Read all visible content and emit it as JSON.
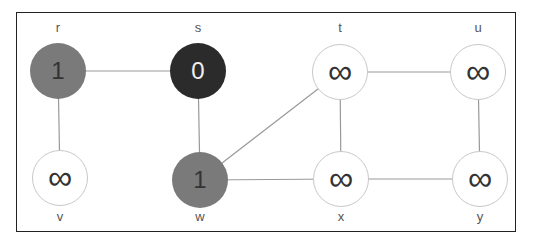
{
  "graph": {
    "type": "undirected",
    "description": "BFS state: source s discovered with distance 0, neighbors r and w at distance 1, all others infinity",
    "colors": {
      "white": "#ffffff",
      "gray": "#7a7a7a",
      "black": "#2b2b2b",
      "edge": "#999999",
      "border": "#222222"
    },
    "nodes": [
      {
        "id": "r",
        "label": "r",
        "value": "1",
        "state": "gray",
        "cx": 58,
        "cy": 71
      },
      {
        "id": "s",
        "label": "s",
        "value": "0",
        "state": "black",
        "cx": 198,
        "cy": 71
      },
      {
        "id": "t",
        "label": "t",
        "value": "∞",
        "state": "white",
        "cx": 340,
        "cy": 72
      },
      {
        "id": "u",
        "label": "u",
        "value": "∞",
        "state": "white",
        "cx": 478,
        "cy": 72
      },
      {
        "id": "v",
        "label": "v",
        "value": "∞",
        "state": "white",
        "cx": 60,
        "cy": 178
      },
      {
        "id": "w",
        "label": "w",
        "value": "1",
        "state": "gray",
        "cx": 200,
        "cy": 180
      },
      {
        "id": "x",
        "label": "x",
        "value": "∞",
        "state": "white",
        "cx": 341,
        "cy": 179
      },
      {
        "id": "y",
        "label": "y",
        "value": "∞",
        "state": "white",
        "cx": 480,
        "cy": 179
      }
    ],
    "edges": [
      [
        "r",
        "s"
      ],
      [
        "r",
        "v"
      ],
      [
        "s",
        "w"
      ],
      [
        "w",
        "t"
      ],
      [
        "w",
        "x"
      ],
      [
        "t",
        "x"
      ],
      [
        "t",
        "u"
      ],
      [
        "x",
        "y"
      ],
      [
        "u",
        "y"
      ]
    ]
  }
}
